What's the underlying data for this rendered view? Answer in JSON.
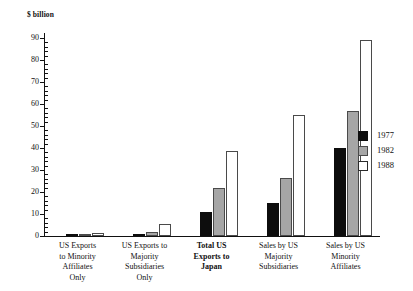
{
  "chart_data": {
    "type": "bar",
    "title": "",
    "subtitle": "",
    "xlabel": "",
    "ylabel": "$ billion",
    "unit_caption": "$ billion",
    "ylim": [
      0,
      90
    ],
    "ytick_step": 10,
    "yticks": [
      0,
      10,
      20,
      30,
      40,
      50,
      60,
      70,
      80,
      90
    ],
    "ytick_labels": [
      "0",
      "10",
      "20",
      "30",
      "40",
      "50",
      "60",
      "70",
      "80",
      "90"
    ],
    "minor_ticks_per_interval": 4,
    "grid": false,
    "legend_position": "right",
    "categories": [
      "US Exports to Minority Affiliates Only",
      "US Exports to Majority Subsidiaries Only",
      "Total US Exports to Japan",
      "Sales by US Majority Subsidiaries",
      "Sales by US Minority Affiliates"
    ],
    "category_lines": [
      [
        "US Exports",
        "to Minority",
        "Affiliates",
        "Only"
      ],
      [
        "US Exports to",
        "Majority",
        "Subsidiaries",
        "Only"
      ],
      [
        "Total US",
        "Exports to",
        "Japan"
      ],
      [
        "Sales by US",
        "Majority",
        "Subsidiaries"
      ],
      [
        "Sales by US",
        "Minority",
        "Affiliates"
      ]
    ],
    "category_emphasis": [
      false,
      false,
      true,
      false,
      false
    ],
    "series": [
      {
        "name": "1977",
        "color": "#0d0d0d",
        "values": [
          0.5,
          1.0,
          11.0,
          15.0,
          40.0
        ]
      },
      {
        "name": "1982",
        "color": "#a6a6a6",
        "values": [
          1.0,
          2.0,
          22.0,
          26.5,
          57.0
        ]
      },
      {
        "name": "1988",
        "color": "#ffffff",
        "values": [
          1.5,
          5.5,
          38.5,
          55.0,
          89.0
        ]
      }
    ]
  },
  "legend": {
    "items": [
      {
        "label": "1977",
        "swatch": "black-filled-swatch"
      },
      {
        "label": "1982",
        "swatch": "gray-filled-swatch"
      },
      {
        "label": "1988",
        "swatch": "white-outline-swatch"
      }
    ]
  },
  "colors": {
    "series_1977": "#0d0d0d",
    "series_1982": "#a6a6a6",
    "series_1988": "#ffffff",
    "axis": "#111111",
    "background": "#ffffff"
  }
}
